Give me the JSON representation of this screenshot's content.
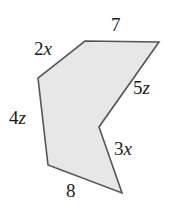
{
  "figure": {
    "name": "concave-hexagon-arrow",
    "fill_color": "#e7e7e7",
    "stroke_color": "#555555",
    "stroke_width": 1.6,
    "background_color": "#ffffff",
    "vertices": [
      {
        "name": "top-left-apex",
        "x": 85,
        "y": 41
      },
      {
        "name": "top-right",
        "x": 159,
        "y": 42
      },
      {
        "name": "concave-notch",
        "x": 99,
        "y": 127
      },
      {
        "name": "bottom-right",
        "x": 122,
        "y": 193
      },
      {
        "name": "bottom-left",
        "x": 48,
        "y": 165
      },
      {
        "name": "left",
        "x": 38,
        "y": 78
      }
    ],
    "labels": [
      {
        "id": "top",
        "coefficient": "7",
        "variable": "",
        "text": "7",
        "side": "top-left-apex-to-top-right"
      },
      {
        "id": "upleft",
        "coefficient": "2",
        "variable": "x",
        "text": "2x",
        "side": "left-to-top-left-apex"
      },
      {
        "id": "right",
        "coefficient": "5",
        "variable": "z",
        "text": "5z",
        "side": "top-right-to-concave-notch"
      },
      {
        "id": "left",
        "coefficient": "4",
        "variable": "z",
        "text": "4z",
        "side": "bottom-left-to-left"
      },
      {
        "id": "lowright",
        "coefficient": "3",
        "variable": "x",
        "text": "3x",
        "side": "concave-notch-to-bottom-right"
      },
      {
        "id": "bottom",
        "coefficient": "8",
        "variable": "",
        "text": "8",
        "side": "bottom-right-to-bottom-left"
      }
    ]
  }
}
